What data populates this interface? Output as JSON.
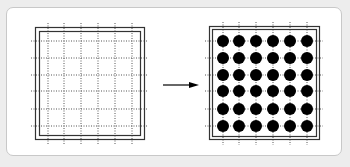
{
  "diagram": {
    "colors": {
      "background": "#ededed",
      "panel": "#ffffff",
      "panel_border": "#c8c8c8",
      "frame_stroke": "#333333",
      "grid_dots": "#555555",
      "dot_fill": "#000000",
      "arrow": "#000000"
    },
    "left_grid": {
      "rows": 6,
      "cols": 6,
      "filled": false,
      "outer_frame": {
        "x": 35,
        "y": 27,
        "w": 109,
        "h": 112
      },
      "inner_frame": {
        "x": 39,
        "y": 31,
        "w": 101,
        "h": 104
      },
      "col_x": [
        48,
        64,
        81,
        98,
        115,
        132
      ],
      "row_y": [
        41,
        58,
        75,
        91,
        109,
        126
      ]
    },
    "arrow": {
      "x1": 163,
      "y1": 85,
      "x2": 199,
      "y2": 85,
      "direction": "right"
    },
    "right_grid": {
      "rows": 6,
      "cols": 6,
      "filled": true,
      "dot_radius": 6,
      "outer_frame": {
        "x": 209,
        "y": 26,
        "w": 110,
        "h": 113
      },
      "inner_frame": {
        "x": 212,
        "y": 29,
        "w": 104,
        "h": 107
      },
      "col_x": [
        223,
        239,
        256,
        273,
        290,
        307
      ],
      "row_y": [
        41,
        58,
        75,
        91,
        109,
        126
      ]
    }
  }
}
